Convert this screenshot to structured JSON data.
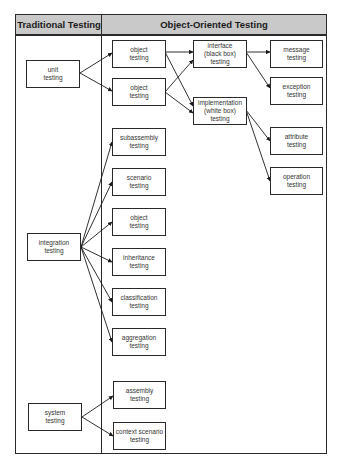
{
  "headers": {
    "traditional": "Traditional Testing",
    "object_oriented": "Object-Oriented Testing"
  },
  "traditional": {
    "unit": "unit\ntesting",
    "integration": "integration\ntesting",
    "system": "system\ntesting"
  },
  "unit_branch": {
    "object_1": "object\ntesting",
    "object_2": "object\ntesting",
    "interface": "interface\n(black box)\ntesting",
    "implementation": "implementation\n(white box)\ntesting",
    "message": "message\ntesting",
    "exception": "exception\ntesting",
    "attribute": "attribute\ntesting",
    "operation": "operation\ntesting"
  },
  "integration_branch": {
    "subassembly": "subassembly\ntesting",
    "scenario": "scenario\ntesting",
    "object": "object\ntesting",
    "inheritance": "inheritance\ntesting",
    "classification": "classification\ntesting",
    "aggregation": "aggregation\ntesting"
  },
  "system_branch": {
    "assembly": "assembly\ntesting",
    "context_scenario": "context scenario\ntesting"
  }
}
